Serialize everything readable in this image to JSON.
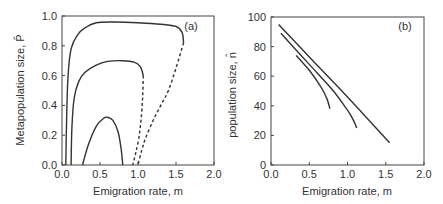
{
  "chart_data": [
    {
      "type": "line",
      "panel_label": "(a)",
      "xlabel": "Emigration rate, m",
      "ylabel": "Metapopulation size, P̂",
      "xlim": [
        0,
        2.0
      ],
      "ylim": [
        0,
        1.0
      ],
      "xticks": [
        "0.0",
        "0.5",
        "1.0",
        "1.5",
        "2.0"
      ],
      "yticks": [
        "0.0",
        "0.2",
        "0.4",
        "0.6",
        "0.8",
        "1.0"
      ],
      "grid": false,
      "series": [
        {
          "name": "outer-stable",
          "style": "solid",
          "x": [
            0.05,
            0.06,
            0.08,
            0.12,
            0.2,
            0.3,
            0.45,
            0.7,
            1.0,
            1.3,
            1.5,
            1.58,
            1.6
          ],
          "y": [
            0.0,
            0.3,
            0.6,
            0.78,
            0.87,
            0.92,
            0.955,
            0.96,
            0.955,
            0.945,
            0.93,
            0.89,
            0.82
          ]
        },
        {
          "name": "outer-unstable",
          "style": "dashed",
          "x": [
            1.6,
            1.5,
            1.4,
            1.3,
            1.2,
            1.1,
            1.05,
            1.0
          ],
          "y": [
            0.82,
            0.65,
            0.5,
            0.4,
            0.3,
            0.18,
            0.1,
            0.0
          ]
        },
        {
          "name": "middle-stable",
          "style": "solid",
          "x": [
            0.12,
            0.13,
            0.16,
            0.22,
            0.3,
            0.45,
            0.6,
            0.8,
            0.95,
            1.03,
            1.07
          ],
          "y": [
            0.0,
            0.25,
            0.45,
            0.56,
            0.62,
            0.67,
            0.695,
            0.7,
            0.69,
            0.66,
            0.6
          ]
        },
        {
          "name": "middle-unstable",
          "style": "dashed",
          "x": [
            1.07,
            1.06,
            1.04,
            1.01,
            0.97,
            0.93
          ],
          "y": [
            0.6,
            0.45,
            0.3,
            0.18,
            0.08,
            0.0
          ]
        },
        {
          "name": "inner",
          "style": "solid",
          "x": [
            0.27,
            0.35,
            0.45,
            0.55,
            0.6,
            0.67,
            0.74,
            0.78,
            0.8
          ],
          "y": [
            0.0,
            0.14,
            0.26,
            0.315,
            0.32,
            0.3,
            0.22,
            0.1,
            0.0
          ]
        }
      ]
    },
    {
      "type": "line",
      "panel_label": "(b)",
      "xlabel": "Emigration rate, m",
      "ylabel": "population size, n̂",
      "xlim": [
        0,
        2.0
      ],
      "ylim": [
        0,
        100
      ],
      "xticks": [
        "0.0",
        "0.5",
        "1.0",
        "1.5",
        "2.0"
      ],
      "yticks": [
        "0",
        "20",
        "40",
        "60",
        "80",
        "100"
      ],
      "grid": false,
      "series": [
        {
          "name": "top",
          "style": "solid",
          "x": [
            0.1,
            0.5,
            1.0,
            1.55
          ],
          "y": [
            95,
            73,
            46,
            15
          ]
        },
        {
          "name": "middle",
          "style": "solid",
          "x": [
            0.13,
            0.5,
            0.8,
            1.0,
            1.08,
            1.12
          ],
          "y": [
            89,
            68,
            51,
            37,
            30,
            25
          ]
        },
        {
          "name": "bottom",
          "style": "solid",
          "x": [
            0.33,
            0.5,
            0.65,
            0.73,
            0.77
          ],
          "y": [
            74,
            64,
            53,
            45,
            38
          ]
        }
      ]
    }
  ]
}
